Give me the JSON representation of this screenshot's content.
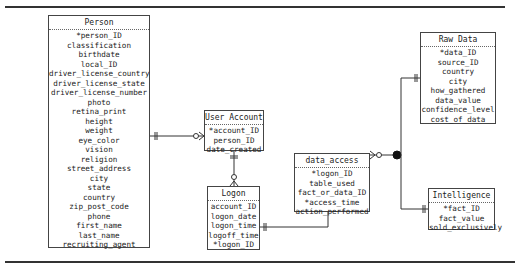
{
  "diagram": {
    "type": "ER diagram",
    "entities": {
      "person": {
        "title": "Person",
        "attributes": [
          "*person_ID",
          "classification",
          "birthdate",
          "local_ID",
          "driver_license_country",
          "driver_license_state",
          "driver_license_number",
          "photo",
          "retina_print",
          "height",
          "weight",
          "eye_color",
          "vision",
          "religion",
          "street_address",
          "city",
          "state",
          "country",
          "zip_post_code",
          "phone",
          "first_name",
          "last_name",
          "recruiting_agent"
        ]
      },
      "user_account": {
        "title": "User Account",
        "attributes": [
          "*account_ID",
          "person_ID",
          "date_created"
        ]
      },
      "logon": {
        "title": "Logon",
        "attributes": [
          "account_ID",
          "logon_date",
          "logon_time",
          "logoff_time",
          "*logon_ID"
        ]
      },
      "data_access": {
        "title": "data_access",
        "attributes": [
          "*logon_ID",
          "table_used",
          "fact_or_data_ID",
          "*access_time",
          "action_performed"
        ]
      },
      "raw_data": {
        "title": "Raw Data",
        "attributes": [
          "*data_ID",
          "source_ID",
          "country",
          "city",
          "how_gathered",
          "data_value",
          "confidence_level",
          "cost_of_data"
        ]
      },
      "intelligence": {
        "title": "Intelligence",
        "attributes": [
          "*fact_ID",
          "fact_value",
          "sold_exclusively"
        ]
      }
    },
    "relationships": [
      {
        "from": "Person",
        "to": "User Account",
        "from_cardinality": "one-and-only-one",
        "to_cardinality": "zero-or-many"
      },
      {
        "from": "User Account",
        "to": "Logon",
        "from_cardinality": "one-and-only-one",
        "to_cardinality": "zero-or-many"
      },
      {
        "from": "Logon",
        "to": "data_access",
        "from_cardinality": "one-and-only-one",
        "to_cardinality": "zero-or-many"
      },
      {
        "from": "data_access",
        "to": "Raw Data / Intelligence (exclusive subtype)",
        "from_cardinality": "zero-or-many",
        "to_cardinality": "one-and-only-one"
      }
    ],
    "colors": {
      "line": "#333333",
      "box_border": "#444444",
      "text": "#222222"
    }
  }
}
